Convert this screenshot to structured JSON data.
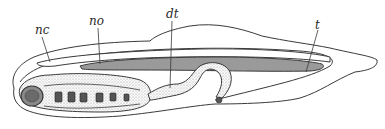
{
  "figure": {
    "labels": [
      {
        "id": "nc",
        "text": "nc",
        "x": 35,
        "y": 24
      },
      {
        "id": "no",
        "text": "no",
        "x": 89,
        "y": 15
      },
      {
        "id": "dt",
        "text": "dt",
        "x": 168,
        "y": 9
      },
      {
        "id": "t",
        "text": "t",
        "x": 314,
        "y": 20
      }
    ],
    "colors": {
      "outline": "#3a3a3a",
      "notochord_fill": "#9a9a9a",
      "gut_stipple": "#d8d8d8",
      "gill_slit": "#555555",
      "background": "#ffffff"
    }
  }
}
